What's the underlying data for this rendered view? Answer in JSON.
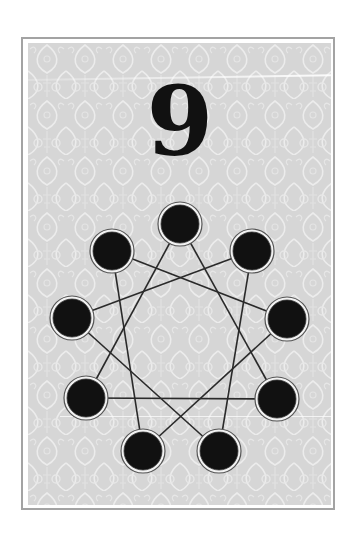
{
  "card": {
    "number": "9",
    "colors": {
      "frame_border": "#a3a3a3",
      "background": "#d6d6d6",
      "pattern": "#ececec",
      "ink": "#111111",
      "line": "#2a2a2a"
    },
    "nodes": [
      {
        "id": 0,
        "position": "top",
        "cx": 180,
        "cy": 224
      },
      {
        "id": 1,
        "position": "upper-right",
        "cx": 252,
        "cy": 251
      },
      {
        "id": 2,
        "position": "right",
        "cx": 287,
        "cy": 319
      },
      {
        "id": 3,
        "position": "lower-right",
        "cx": 277,
        "cy": 399
      },
      {
        "id": 4,
        "position": "bottom-right",
        "cx": 219,
        "cy": 451
      },
      {
        "id": 5,
        "position": "bottom-left",
        "cx": 143,
        "cy": 451
      },
      {
        "id": 6,
        "position": "lower-left",
        "cx": 86,
        "cy": 398
      },
      {
        "id": 7,
        "position": "left",
        "cx": 72,
        "cy": 318
      },
      {
        "id": 8,
        "position": "upper-left",
        "cx": 112,
        "cy": 251
      }
    ],
    "edges": [
      [
        0,
        3
      ],
      [
        0,
        6
      ],
      [
        3,
        6
      ],
      [
        1,
        4
      ],
      [
        1,
        7
      ],
      [
        4,
        7
      ],
      [
        2,
        5
      ],
      [
        2,
        8
      ],
      [
        5,
        8
      ]
    ]
  }
}
